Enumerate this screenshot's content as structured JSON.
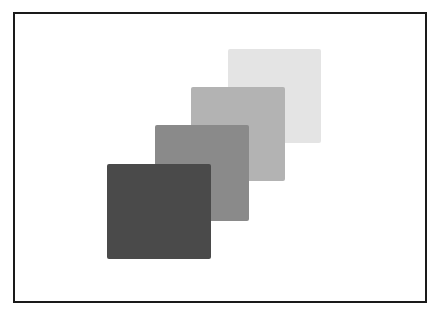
{
  "figure": {
    "swatches": [
      {
        "name": "lightest",
        "color": "#e4e4e4",
        "x": 228,
        "y": 49,
        "w": 93,
        "h": 94
      },
      {
        "name": "light",
        "color": "#b3b3b3",
        "x": 191,
        "y": 87,
        "w": 94,
        "h": 94
      },
      {
        "name": "medium",
        "color": "#8a8a8a",
        "x": 155,
        "y": 125,
        "w": 94,
        "h": 96
      },
      {
        "name": "dark",
        "color": "#4a4a4a",
        "x": 107,
        "y": 164,
        "w": 104,
        "h": 95
      }
    ]
  }
}
